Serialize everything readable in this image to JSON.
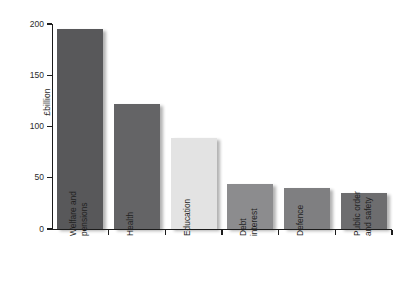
{
  "chart_data": {
    "type": "bar",
    "title": "",
    "subtitle": "",
    "xlabel": "",
    "ylabel": "£billion",
    "ylim": [
      0,
      200
    ],
    "yticks": [
      0,
      50,
      100,
      150,
      200
    ],
    "ytick_labels": [
      "0",
      "50",
      "100",
      "150",
      "200"
    ],
    "grid": false,
    "legend": false,
    "categories": [
      "Welfare and pensions",
      "Health",
      "Education",
      "Debt interest",
      "Defence",
      "Public order and safety"
    ],
    "category_lines": [
      [
        "Welfare and",
        "pensions"
      ],
      [
        "Health"
      ],
      [
        "Education"
      ],
      [
        "Debt",
        "interest"
      ],
      [
        "Defence"
      ],
      [
        "Public order",
        "and safety"
      ]
    ],
    "values": [
      195,
      122,
      89,
      44,
      40,
      35
    ],
    "bar_colors": [
      "#58585a",
      "#646466",
      "#e3e3e3",
      "#8c8c8e",
      "#7f7f81",
      "#6d6d6f"
    ]
  },
  "axes": {
    "y_title": "£billion",
    "y_tick_labels": [
      "200",
      "150",
      "100",
      "50",
      "0"
    ]
  }
}
